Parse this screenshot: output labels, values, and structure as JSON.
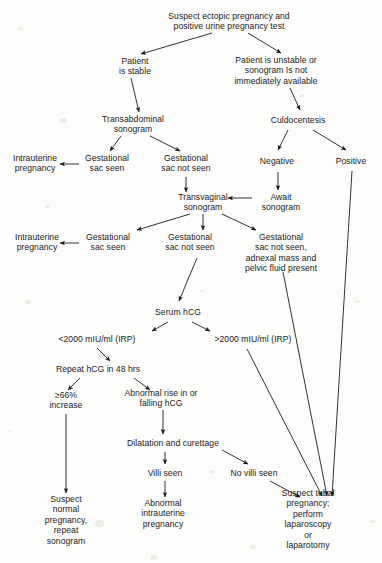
{
  "diagram": {
    "type": "flowchart",
    "line_color": "#1a1a1a",
    "text_color": "#1a1a1a",
    "background_color": "#fdfdfb",
    "nodes": [
      {
        "id": "n1",
        "label": "Suspect ectopic pregnancy and\npositive urine pregnancy test",
        "x": 229,
        "y": 21
      },
      {
        "id": "n2",
        "label": "Patient\nis stable",
        "x": 135,
        "y": 66
      },
      {
        "id": "n3",
        "label": "Patient is unstable or\nsonogram Is not\nimmediately available",
        "x": 276,
        "y": 71
      },
      {
        "id": "n4",
        "label": "Transabdominal\nsonogram",
        "x": 133,
        "y": 124
      },
      {
        "id": "n5",
        "label": "Culdocentesis",
        "x": 298,
        "y": 120
      },
      {
        "id": "n6",
        "label": "Intrauterine\npregnancy",
        "x": 35,
        "y": 163
      },
      {
        "id": "n7",
        "label": "Gestational\nsac seen",
        "x": 107,
        "y": 163
      },
      {
        "id": "n8",
        "label": "Gestational\nsac not seen",
        "x": 186,
        "y": 163
      },
      {
        "id": "n9",
        "label": "Negative",
        "x": 277,
        "y": 161
      },
      {
        "id": "n10",
        "label": "Positive",
        "x": 351,
        "y": 161
      },
      {
        "id": "n11",
        "label": "Transvaginal\nsonogram",
        "x": 203,
        "y": 202
      },
      {
        "id": "n12",
        "label": "Await\nsonogram",
        "x": 281,
        "y": 202
      },
      {
        "id": "n13",
        "label": "Intrauterine\npregnancy",
        "x": 37,
        "y": 242
      },
      {
        "id": "n14",
        "label": "Gestational\nsac seen",
        "x": 108,
        "y": 242
      },
      {
        "id": "n15",
        "label": "Gestational\nsac not seen",
        "x": 190,
        "y": 242
      },
      {
        "id": "n16",
        "label": "Gestational\nsac not seen,\nadnexal mass and\npelvic fluid present",
        "x": 281,
        "y": 253
      },
      {
        "id": "n17",
        "label": "Serum hCG",
        "x": 178,
        "y": 312
      },
      {
        "id": "n18",
        "label": "<2000 mIU/ml (IRP)",
        "x": 97,
        "y": 339
      },
      {
        "id": "n19",
        "label": ">2000 mIU/ml (IRP)",
        "x": 253,
        "y": 339
      },
      {
        "id": "n20",
        "label": "Repeat hCG in 48 hrs",
        "x": 98,
        "y": 369
      },
      {
        "id": "n21",
        "label": "≥66%\nincrease",
        "x": 66,
        "y": 400
      },
      {
        "id": "n22",
        "label": "Abnormal rise in or\nfalling hCG",
        "x": 161,
        "y": 398
      },
      {
        "id": "n23",
        "label": "Dilatation and curettage",
        "x": 173,
        "y": 443
      },
      {
        "id": "n24",
        "label": "Villi seen",
        "x": 165,
        "y": 473
      },
      {
        "id": "n25",
        "label": "No villi seen",
        "x": 254,
        "y": 473
      },
      {
        "id": "n26",
        "label": "Suspect\nnormal\npregnancy,\nrepeat\nsonogram",
        "x": 66,
        "y": 520
      },
      {
        "id": "n27",
        "label": "Abnormal\nintrauterine\npregnancy",
        "x": 163,
        "y": 514
      },
      {
        "id": "n28",
        "label": "Suspect tubal pregnancy;\nperform laparoscopy\nor\nlaparotomy",
        "x": 308,
        "y": 519
      }
    ],
    "edges": [
      {
        "from": "n1",
        "to": "n2",
        "x1": 212,
        "y1": 33,
        "x2": 141,
        "y2": 54
      },
      {
        "from": "n1",
        "to": "n3",
        "x1": 248,
        "y1": 33,
        "x2": 281,
        "y2": 53
      },
      {
        "from": "n2",
        "to": "n4",
        "x1": 131,
        "y1": 78,
        "x2": 139,
        "y2": 112
      },
      {
        "from": "n3",
        "to": "n5",
        "x1": 290,
        "y1": 88,
        "x2": 300,
        "y2": 110
      },
      {
        "from": "n4",
        "to": "n7",
        "x1": 121,
        "y1": 136,
        "x2": 110,
        "y2": 151
      },
      {
        "from": "n4",
        "to": "n8",
        "x1": 150,
        "y1": 136,
        "x2": 180,
        "y2": 151
      },
      {
        "from": "n5",
        "to": "n9",
        "x1": 288,
        "y1": 130,
        "x2": 278,
        "y2": 150
      },
      {
        "from": "n5",
        "to": "n10",
        "x1": 313,
        "y1": 130,
        "x2": 346,
        "y2": 150
      },
      {
        "from": "n7",
        "to": "n6",
        "x1": 79,
        "y1": 164,
        "x2": 60,
        "y2": 164
      },
      {
        "from": "n8",
        "to": "n11",
        "x1": 186,
        "y1": 177,
        "x2": 186,
        "y2": 192
      },
      {
        "from": "n9",
        "to": "n12",
        "x1": 278,
        "y1": 172,
        "x2": 278,
        "y2": 190
      },
      {
        "from": "n12",
        "to": "n11",
        "x1": 252,
        "y1": 198,
        "x2": 228,
        "y2": 198
      },
      {
        "from": "n11",
        "to": "n14",
        "x1": 190,
        "y1": 214,
        "x2": 137,
        "y2": 230
      },
      {
        "from": "n11",
        "to": "n15",
        "x1": 203,
        "y1": 214,
        "x2": 203,
        "y2": 230
      },
      {
        "from": "n11",
        "to": "n16",
        "x1": 222,
        "y1": 214,
        "x2": 256,
        "y2": 230
      },
      {
        "from": "n14",
        "to": "n13",
        "x1": 79,
        "y1": 243,
        "x2": 60,
        "y2": 243
      },
      {
        "from": "n15",
        "to": "n17",
        "x1": 197,
        "y1": 258,
        "x2": 179,
        "y2": 301
      },
      {
        "from": "n17",
        "to": "n18",
        "x1": 168,
        "y1": 322,
        "x2": 152,
        "y2": 331
      },
      {
        "from": "n17",
        "to": "n19",
        "x1": 192,
        "y1": 322,
        "x2": 210,
        "y2": 331
      },
      {
        "from": "n18",
        "to": "n20",
        "x1": 97,
        "y1": 348,
        "x2": 110,
        "y2": 361
      },
      {
        "from": "n20",
        "to": "n21",
        "x1": 80,
        "y1": 378,
        "x2": 68,
        "y2": 390
      },
      {
        "from": "n20",
        "to": "n22",
        "x1": 134,
        "y1": 378,
        "x2": 150,
        "y2": 390
      },
      {
        "from": "n21",
        "to": "n26",
        "x1": 66,
        "y1": 414,
        "x2": 66,
        "y2": 493
      },
      {
        "from": "n22",
        "to": "n23",
        "x1": 163,
        "y1": 410,
        "x2": 163,
        "y2": 434
      },
      {
        "from": "n23",
        "to": "n24",
        "x1": 165,
        "y1": 452,
        "x2": 165,
        "y2": 464
      },
      {
        "from": "n23",
        "to": "n25",
        "x1": 222,
        "y1": 450,
        "x2": 248,
        "y2": 464
      },
      {
        "from": "n24",
        "to": "n27",
        "x1": 165,
        "y1": 481,
        "x2": 165,
        "y2": 497
      },
      {
        "from": "n25",
        "to": "n28",
        "x1": 270,
        "y1": 481,
        "x2": 300,
        "y2": 497
      },
      {
        "from": "n19",
        "to": "n28",
        "x1": 247,
        "y1": 349,
        "x2": 322,
        "y2": 496
      },
      {
        "from": "n16",
        "to": "n28",
        "x1": 283,
        "y1": 272,
        "x2": 327,
        "y2": 496
      },
      {
        "from": "n10",
        "to": "n28",
        "x1": 352,
        "y1": 171,
        "x2": 332,
        "y2": 496
      }
    ]
  }
}
